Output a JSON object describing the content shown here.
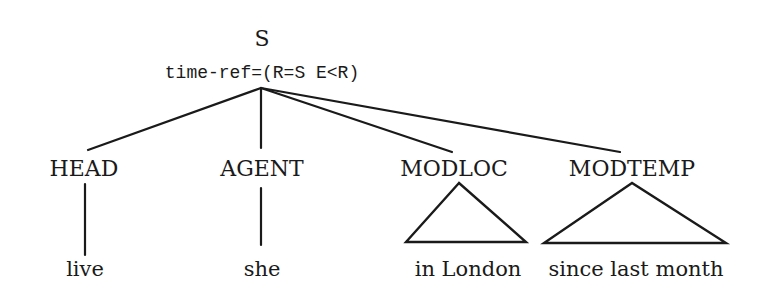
{
  "root": {
    "label": "S",
    "feature": "time-ref=(R=S E<R)"
  },
  "children": [
    {
      "label": "HEAD",
      "leaf": "live",
      "leaf_type": "line"
    },
    {
      "label": "AGENT",
      "leaf": "she",
      "leaf_type": "line"
    },
    {
      "label": "MODLOC",
      "leaf": "in London",
      "leaf_type": "triangle"
    },
    {
      "label": "MODTEMP",
      "leaf": "since last month",
      "leaf_type": "triangle"
    }
  ]
}
